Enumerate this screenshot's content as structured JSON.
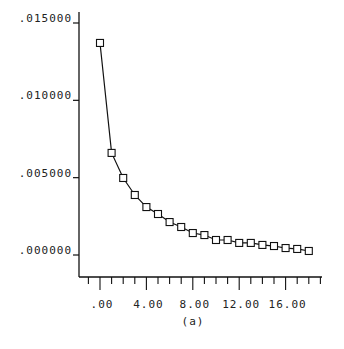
{
  "chart_data": {
    "type": "line",
    "title": "",
    "caption": "(a)",
    "xlabel": "",
    "ylabel": "",
    "x": [
      0,
      1,
      2,
      3,
      4,
      5,
      6,
      7,
      8,
      9,
      10,
      11,
      12,
      13,
      14,
      15,
      16,
      17,
      18
    ],
    "series": [
      {
        "name": "series",
        "marker": "square",
        "values": [
          0.01371,
          0.0066,
          0.00498,
          0.00388,
          0.0031,
          0.00265,
          0.00213,
          0.00181,
          0.00142,
          0.00129,
          0.00097,
          0.00097,
          0.00078,
          0.00078,
          0.00065,
          0.00058,
          0.00045,
          0.00039,
          0.00026
        ]
      }
    ],
    "xticks": [
      0,
      4,
      8,
      12,
      16
    ],
    "xtick_labels": [
      ".00",
      "4.00",
      "8.00",
      "12.00",
      "16.00"
    ],
    "yticks": [
      0,
      0.005,
      0.01,
      0.015
    ],
    "ytick_labels": [
      ".000000",
      ".005000",
      ".010000",
      ".015000"
    ],
    "xlim": [
      -2,
      19.5
    ],
    "ylim": [
      -0.0014,
      0.015
    ],
    "grid": false,
    "legend": null
  }
}
